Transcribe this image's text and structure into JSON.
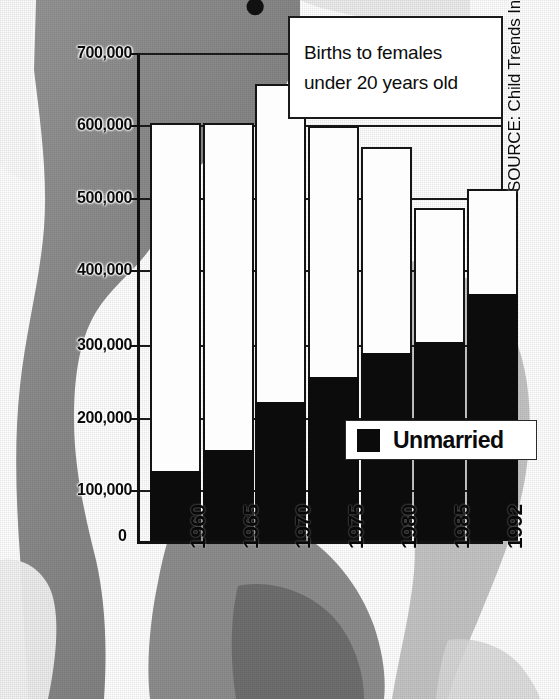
{
  "chart_data": {
    "type": "bar",
    "subtype": "stacked",
    "title": "Births to females under 20 years old",
    "xlabel": "",
    "ylabel": "",
    "categories": [
      "1960",
      "1965",
      "1970",
      "1975",
      "1980",
      "1985",
      "1992"
    ],
    "series": [
      {
        "name": "Unmarried",
        "color": "#0b0b0b",
        "values": [
          100000,
          130000,
          200000,
          235000,
          270000,
          285000,
          355000
        ]
      },
      {
        "name": "Married",
        "color": "#fdfdfd",
        "values": [
          500000,
          470000,
          455000,
          360000,
          295000,
          193000,
          150000
        ]
      }
    ],
    "totals": [
      600000,
      600000,
      655000,
      595000,
      565000,
      478000,
      505000
    ],
    "ylim": [
      0,
      700000
    ],
    "ytick_values": [
      0,
      100000,
      200000,
      300000,
      400000,
      500000,
      600000,
      700000
    ],
    "ytick_labels": [
      "0",
      "100,000",
      "200,000",
      "300,000",
      "400,000",
      "500,000",
      "600,000",
      "700,000"
    ],
    "grid": true,
    "legend_position": "inside-right",
    "annotations": [
      "Births to females under 20 years old"
    ],
    "source": "SOURCE: Child Trends Inc."
  },
  "callout": {
    "line1": "Births to females",
    "line2": "under 20 years old"
  },
  "legend": {
    "label": "Unmarried"
  },
  "source": {
    "text": "SOURCE: Child Trends Inc."
  },
  "title_fragment": {
    "glyph": "●"
  }
}
